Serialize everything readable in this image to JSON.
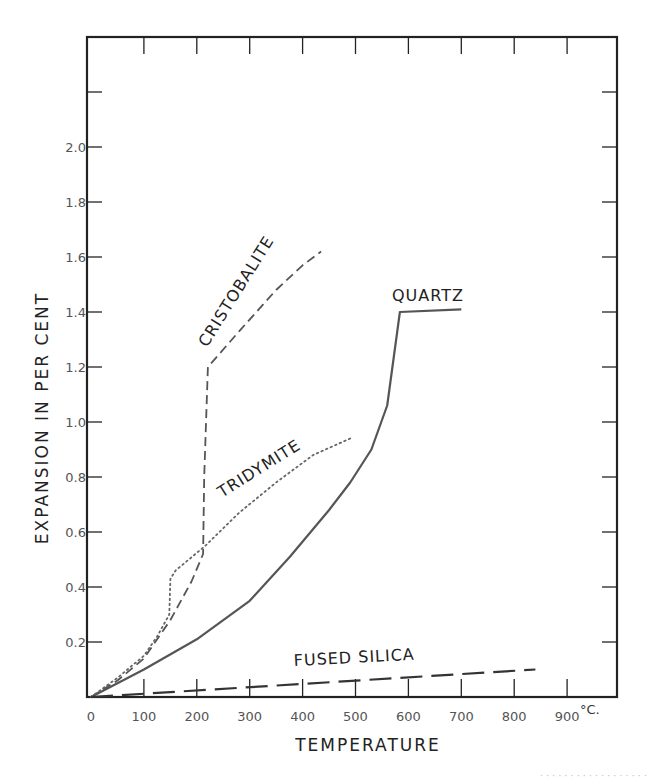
{
  "chart_data": {
    "type": "line",
    "title": "",
    "xlabel": "TEMPERATURE",
    "ylabel": "EXPANSION IN PER CENT",
    "x_unit": "°C.",
    "xlim": [
      0,
      1000
    ],
    "ylim": [
      0,
      2.4
    ],
    "x_ticks": [
      0,
      100,
      200,
      300,
      400,
      500,
      600,
      700,
      800,
      900
    ],
    "x_tick_labels": [
      "0",
      "100",
      "200",
      "300",
      "400",
      "500",
      "600",
      "700",
      "800",
      "900"
    ],
    "y_ticks": [
      0.2,
      0.4,
      0.6,
      0.8,
      1.0,
      1.2,
      1.4,
      1.6,
      1.8,
      2.0,
      2.2
    ],
    "y_tick_labels": [
      "0.2",
      "0.4",
      "0.6",
      "0.8",
      "1.0",
      "1.2",
      "1.4",
      "1.6",
      "1.8",
      "2.0",
      ""
    ],
    "grid": false,
    "legend": "inline labels",
    "series": [
      {
        "name": "QUARTZ",
        "style": "solid",
        "x": [
          0,
          100,
          200,
          300,
          376,
          450,
          490,
          530,
          560,
          584,
          700
        ],
        "y": [
          0,
          0.1,
          0.21,
          0.35,
          0.51,
          0.68,
          0.78,
          0.9,
          1.06,
          1.4,
          1.41
        ]
      },
      {
        "name": "CRISTOBALITE",
        "style": "dashed",
        "x": [
          0,
          50,
          100,
          150,
          190,
          212,
          214,
          221,
          280,
          350,
          400,
          435
        ],
        "y": [
          0,
          0.06,
          0.14,
          0.28,
          0.42,
          0.52,
          0.8,
          1.2,
          1.33,
          1.48,
          1.57,
          1.62
        ]
      },
      {
        "name": "TRIDYMITE",
        "style": "dotted",
        "x": [
          0,
          50,
          100,
          125,
          148,
          150,
          160,
          216,
          280,
          350,
          420,
          490
        ],
        "y": [
          0,
          0.07,
          0.15,
          0.22,
          0.3,
          0.43,
          0.46,
          0.55,
          0.67,
          0.78,
          0.88,
          0.94
        ]
      },
      {
        "name": "FUSED SILICA",
        "style": "long-dashed",
        "x": [
          0,
          840
        ],
        "y": [
          0,
          0.1
        ]
      }
    ]
  },
  "labels": {
    "quartz": "QUARTZ",
    "cristobalite": "CRISTOBALITE",
    "tridymite": "TRIDYMITE",
    "fused_silica": "FUSED  SILICA",
    "xlabel": "TEMPERATURE",
    "ylabel": "EXPANSION  IN  PER  CENT",
    "unit": "°C."
  },
  "caption": "· · ·   ·  · · ·   · ·  · ·   · · ·  ·  · · ·"
}
